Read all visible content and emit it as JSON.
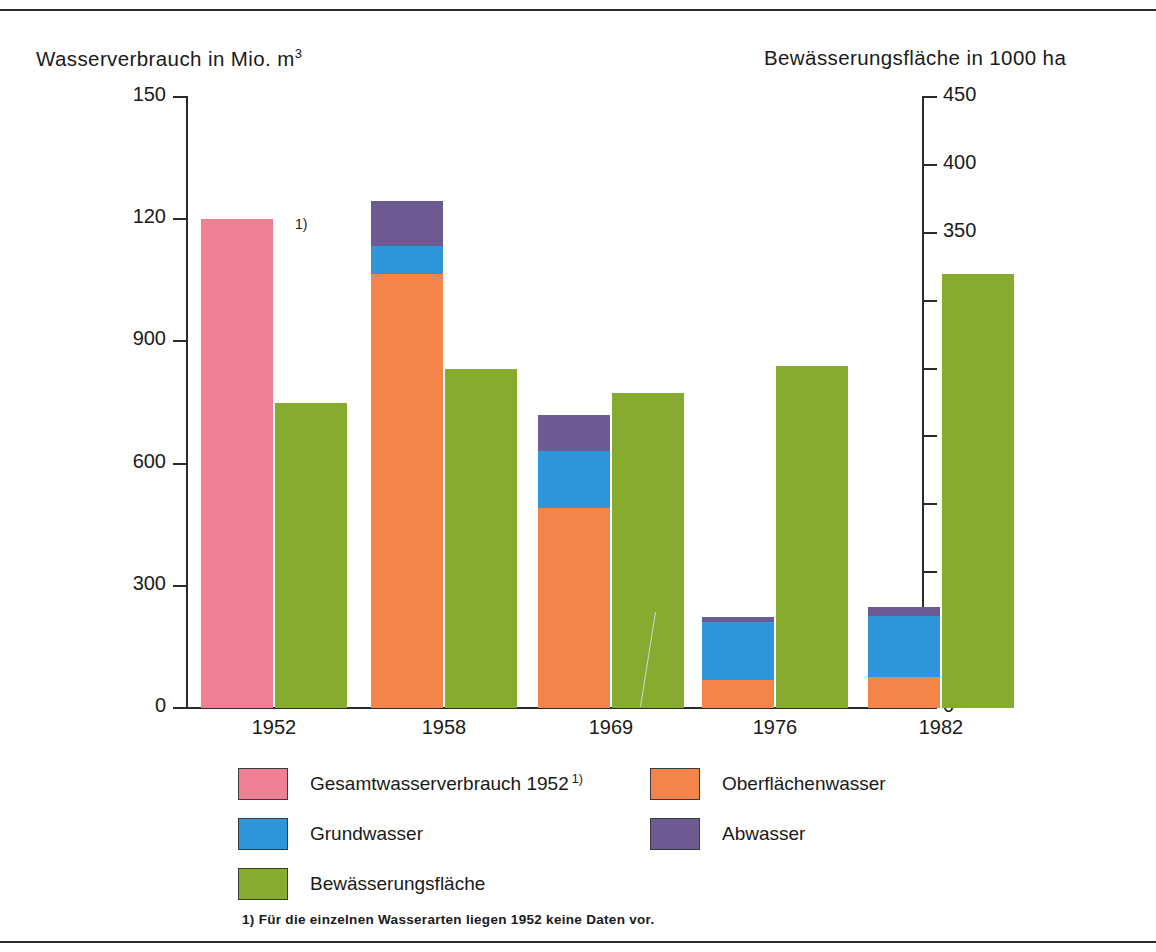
{
  "left_axis_caption": "Wasserverbrauch in Mio. m",
  "left_axis_caption_sup": "3",
  "right_axis_caption": "Bewässerungsfläche in 1000 ha",
  "footnote_marker": "1)",
  "footnote": "1) Für die einzelnen Wasserarten liegen 1952 keine Daten vor.",
  "legend": [
    {
      "label": "Gesamtwasserverbrauch 1952",
      "sup": "1)",
      "color": "#ef7f94",
      "name": "gesamtwasserverbrauch"
    },
    {
      "label": "Oberflächenwasser",
      "sup": "",
      "color": "#f4854a",
      "name": "oberflaechenwasser"
    },
    {
      "label": "Grundwasser",
      "sup": "",
      "color": "#2e95d8",
      "name": "grundwasser"
    },
    {
      "label": "Abwasser",
      "sup": "",
      "color": "#6c5a93",
      "name": "abwasser"
    },
    {
      "label": "Bewässerungsfläche",
      "sup": "",
      "color": "#86ab2e",
      "name": "bewaesserungsflaeche"
    }
  ],
  "chart_data": {
    "type": "bar",
    "subtype": "stacked-bar-dual-axis",
    "title": "",
    "xlabel": "",
    "categories": [
      "1952",
      "1958",
      "1969",
      "1976",
      "1982"
    ],
    "left_axis": {
      "label": "Wasserverbrauch in Mio. m3",
      "ticks": [
        "0",
        "300",
        "600",
        "900",
        "120",
        "150"
      ],
      "tick_values": [
        0,
        300,
        600,
        900,
        1200,
        1500
      ],
      "range": [
        0,
        1500
      ],
      "unit": "Mio. m3"
    },
    "right_axis": {
      "label": "Bewässerungsfläche in 1000 ha",
      "ticks": [
        "0",
        "50",
        "100",
        "150",
        "200",
        "250",
        "300",
        "350",
        "400",
        "450"
      ],
      "tick_values": [
        0,
        50,
        100,
        150,
        200,
        250,
        300,
        350,
        400,
        450
      ],
      "range": [
        0,
        450
      ],
      "unit": "1000 ha"
    },
    "grid": false,
    "legend_position": "bottom",
    "series": [
      {
        "name": "Gesamtwasserverbrauch 1952",
        "axis": "left",
        "color": "#ef7f94",
        "values": [
          1200,
          null,
          null,
          null,
          null
        ]
      },
      {
        "name": "Oberflächenwasser",
        "axis": "left",
        "color": "#f4854a",
        "values": [
          null,
          1065,
          490,
          70,
          75
        ]
      },
      {
        "name": "Grundwasser",
        "axis": "left",
        "color": "#2e95d8",
        "values": [
          null,
          70,
          140,
          142,
          152
        ]
      },
      {
        "name": "Abwasser",
        "axis": "left",
        "color": "#6c5a93",
        "values": [
          null,
          110,
          90,
          12,
          22
        ]
      },
      {
        "name": "Bewässerungsfläche",
        "axis": "right",
        "color": "#86ab2e",
        "values": [
          225,
          250,
          232,
          252,
          320
        ]
      }
    ],
    "stack_totals_left": [
      1200,
      1245,
      720,
      224,
      249
    ],
    "annotations": [
      {
        "text": "1)",
        "target": "1952",
        "note": "footnote marker next to 1952 total bar"
      }
    ]
  }
}
